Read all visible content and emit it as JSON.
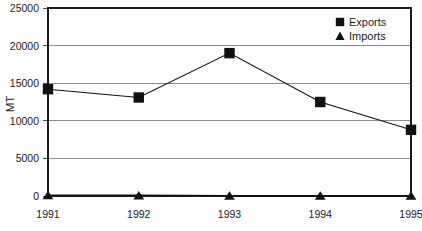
{
  "chart_data": {
    "type": "line",
    "title": "",
    "xlabel": "",
    "ylabel": "MT",
    "categories": [
      "1991",
      "1992",
      "1993",
      "1994",
      "1995"
    ],
    "ylim": [
      0,
      25000
    ],
    "yticks": [
      0,
      5000,
      10000,
      15000,
      20000,
      25000
    ],
    "ytick_labels": [
      "0",
      "5000",
      "10000",
      "15000",
      "20000",
      "25000"
    ],
    "grid": true,
    "legend_position": "top-right-inside",
    "series": [
      {
        "name": "Exports",
        "marker": "square",
        "color": "#111111",
        "values": [
          14200,
          13100,
          19000,
          12500,
          8800
        ]
      },
      {
        "name": "Imports",
        "marker": "triangle",
        "color": "#111111",
        "values": [
          120,
          110,
          60,
          60,
          60
        ]
      }
    ]
  },
  "legend": {
    "items": [
      {
        "label": "Exports",
        "marker": "square-marker"
      },
      {
        "label": "Imports",
        "marker": "triangle-marker"
      }
    ]
  }
}
